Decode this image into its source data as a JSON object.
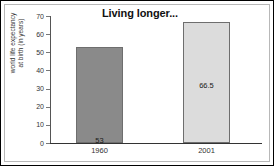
{
  "chart_data": {
    "type": "bar",
    "title": "Living longer...",
    "xlabel": "",
    "ylabel_line1": "world life expectancy",
    "ylabel_line2": "at birth (in years)",
    "categories": [
      "1960",
      "2001"
    ],
    "values": [
      53,
      66.5
    ],
    "value_labels": [
      "53",
      "66.5"
    ],
    "ylim": [
      0,
      70
    ],
    "ytick_labels": [
      "70",
      "60",
      "50",
      "40",
      "30",
      "20",
      "10",
      "0"
    ],
    "ytick_values": [
      70,
      60,
      50,
      40,
      30,
      20,
      10,
      0
    ],
    "grid": false,
    "legend": false,
    "bar_colors": [
      "#8a8a8a",
      "#dcdcdc"
    ],
    "bar_border_color": "#6e6e6e",
    "axis_color": "#333333",
    "text_color": "#333333"
  }
}
